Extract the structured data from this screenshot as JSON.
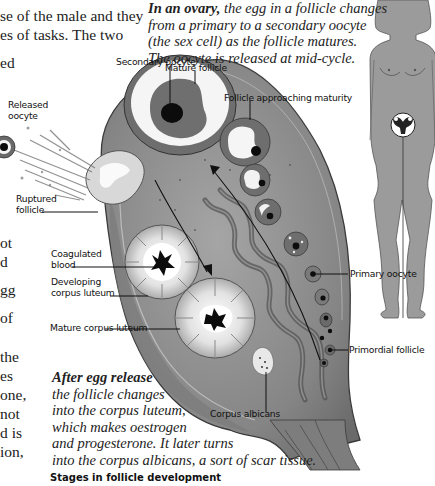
{
  "body_text": {
    "lines": [
      {
        "text": "se of the male and they",
        "x": 0,
        "y": 9
      },
      {
        "text": "es of tasks. The two",
        "x": 0,
        "y": 28
      },
      {
        "text": "ed",
        "x": 0,
        "y": 56
      },
      {
        "text": "ot",
        "x": 0,
        "y": 236
      },
      {
        "text": "d",
        "x": 0,
        "y": 255
      },
      {
        "text": "gg",
        "x": 0,
        "y": 284
      },
      {
        "text": "of",
        "x": 0,
        "y": 312
      },
      {
        "text": " the",
        "x": 0,
        "y": 352
      },
      {
        "text": "es",
        "x": 0,
        "y": 371
      },
      {
        "text": "one,",
        "x": 0,
        "y": 390
      },
      {
        "text": "not",
        "x": 0,
        "y": 409
      },
      {
        "text": "d is",
        "x": 0,
        "y": 428
      },
      {
        "text": "ion,",
        "x": 0,
        "y": 447
      }
    ]
  },
  "captions": {
    "ovary": {
      "lead": "In an ovary,",
      "line1_rest": " the egg in a follicle changes",
      "line2": "from a primary to a secondary oocyte",
      "line3": "(the sex cell) as the follicle matures.",
      "line4": "The oocyte is released at mid-cycle."
    },
    "after_release": {
      "lead": "After egg release",
      "line2": "the follicle changes",
      "line3": "into the corpus luteum,",
      "line4": "which makes oestrogen",
      "line5": "and progesterone. It later turns",
      "line6": "into the corpus albicans, a sort of scar tissue."
    }
  },
  "labels": {
    "secondary_oocyte": "Secondary oocyte",
    "mature_follicle": "Mature follicle",
    "follicle_approaching_maturity": "Follicle approaching maturity",
    "released_oocyte_1": "Released",
    "released_oocyte_2": "oocyte",
    "ruptured_follicle_1": "Ruptured",
    "ruptured_follicle_2": "follicle",
    "coagulated_blood_1": "Coagulated",
    "coagulated_blood_2": "blood",
    "developing_corpus_luteum_1": "Developing",
    "developing_corpus_luteum_2": "corpus luteum",
    "mature_corpus_luteum": "Mature corpus luteum",
    "primary_oocyte": "Primary oocyte",
    "primordial_follicle": "Primordial follicle",
    "corpus_albicans": "Corpus albicans"
  },
  "section_heading": "Stages in follicle development",
  "colors": {
    "ovary_fill": "#8a8a8a",
    "ovary_dark": "#5e5e5e",
    "follicle_white": "#f4f4f4",
    "body_figure": "#9a9a9a",
    "text": "#1a1a1a"
  }
}
